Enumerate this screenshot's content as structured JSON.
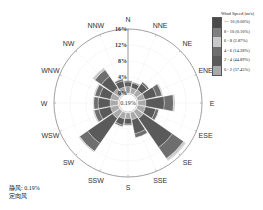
{
  "chart_data": {
    "type": "wind-rose",
    "title": "",
    "legend_title": "Wind Speed (m/s)",
    "radial_ticks": [
      "0%",
      "4%",
      "8%",
      "12%",
      "16%"
    ],
    "radial_max": 16,
    "calm_label": "0.19%",
    "directions": [
      "N",
      "NNE",
      "NE",
      "ENE",
      "E",
      "ESE",
      "SE",
      "SSE",
      "S",
      "SSW",
      "SW",
      "WSW",
      "W",
      "WNW",
      "NW",
      "NNW"
    ],
    "speed_bins": [
      {
        "label": "0 - 2 (37.45%)",
        "color": "#a9a9a9"
      },
      {
        "label": "2 - 4 (44.89%)",
        "color": "#5a5a5a"
      },
      {
        "label": "4 - 6 (14.28%)",
        "color": "#6e6e6e"
      },
      {
        "label": "6 - 8 (2.87%)",
        "color": "#c8c8c8"
      },
      {
        "label": "8 - 10 (0.10%)",
        "color": "#7f7f7f"
      },
      {
        "label": ">= 10 (0.00%)",
        "color": "#4a4a4a"
      }
    ],
    "series": [
      {
        "name": "0 - 2",
        "values": [
          1.6,
          1.4,
          1.6,
          1.8,
          2.0,
          2.0,
          2.2,
          1.8,
          1.4,
          1.6,
          2.2,
          2.0,
          2.0,
          2.0,
          2.0,
          1.6
        ]
      },
      {
        "name": "2 - 4",
        "values": [
          1.2,
          1.2,
          1.8,
          3.0,
          4.6,
          2.6,
          8.8,
          3.6,
          1.4,
          1.6,
          7.6,
          3.0,
          3.0,
          2.8,
          3.6,
          1.6
        ]
      },
      {
        "name": "4 - 6",
        "values": [
          0.3,
          0.3,
          0.5,
          1.4,
          2.3,
          0.8,
          3.4,
          1.0,
          0.3,
          0.4,
          2.4,
          1.2,
          1.1,
          1.2,
          2.0,
          0.5
        ]
      },
      {
        "name": "6 - 8",
        "values": [
          0.1,
          0.1,
          0.1,
          0.3,
          0.4,
          0.1,
          0.6,
          0.1,
          0.1,
          0.1,
          0.3,
          0.3,
          0.2,
          0.3,
          0.6,
          0.1
        ]
      },
      {
        "name": "8 - 10",
        "values": [
          0,
          0,
          0,
          0,
          0,
          0,
          0.05,
          0,
          0,
          0,
          0,
          0,
          0,
          0,
          0.05,
          0
        ]
      },
      {
        "name": ">= 10",
        "values": [
          0,
          0,
          0,
          0,
          0,
          0,
          0,
          0,
          0,
          0,
          0,
          0,
          0,
          0,
          0,
          0
        ]
      }
    ],
    "totals_percent": [
      3.2,
      3.0,
      4.0,
      6.5,
      9.3,
      5.5,
      15.0,
      6.5,
      3.2,
      3.7,
      12.5,
      6.5,
      6.3,
      6.3,
      8.2,
      3.8
    ],
    "annotations": [
      "静风: 0.19%",
      "定向风"
    ]
  },
  "legend": {
    "title": "Wind Speed (m/s)",
    "items": [
      {
        "label": ">= 10 (0.00%)",
        "color": "#4a4a4a"
      },
      {
        "label": "8 - 10 (0.10%)",
        "color": "#7f7f7f"
      },
      {
        "label": "6 - 8 (2.87%)",
        "color": "#c8c8c8"
      },
      {
        "label": "4 - 6 (14.28%)",
        "color": "#6e6e6e"
      },
      {
        "label": "2 - 4 (44.89%)",
        "color": "#5a5a5a"
      },
      {
        "label": "0 - 2 (37.45%)",
        "color": "#a9a9a9"
      }
    ]
  },
  "footnote": {
    "calm": "静风: 0.19%",
    "directional": "定向风"
  }
}
